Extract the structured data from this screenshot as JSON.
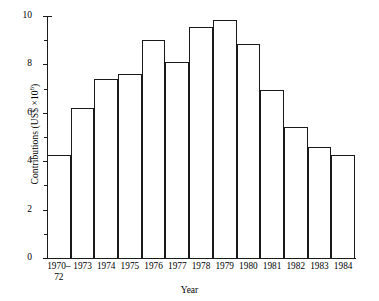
{
  "chart_data": {
    "type": "bar",
    "title": "",
    "xlabel": "Year",
    "ylabel": "Contributions (US$ × 10⁶)",
    "ylabel_prefix": "Contributions (US$ ×10",
    "ylabel_exponent": "6",
    "ylabel_suffix": ")",
    "categories": [
      "1970–\n72",
      "1973",
      "1974",
      "1975",
      "1976",
      "1977",
      "1978",
      "1979",
      "1980",
      "1981",
      "1982",
      "1983",
      "1984"
    ],
    "values": [
      4.25,
      6.2,
      7.4,
      7.6,
      9.0,
      8.1,
      9.55,
      9.85,
      8.85,
      6.95,
      5.4,
      4.6,
      4.25
    ],
    "ylim": [
      0,
      10
    ],
    "ytick_labels": [
      "0",
      "2",
      "4",
      "6",
      "8",
      "10"
    ],
    "ytick_values": [
      0,
      2,
      4,
      6,
      8,
      10
    ],
    "yminor_values": [
      1,
      3,
      5,
      7,
      9
    ],
    "grid": false,
    "legend": false,
    "bar_color": "#ffffff",
    "bar_edge_color": "#1a1a1a",
    "axis_color": "#1a1a1a",
    "background": "#ffffff"
  }
}
